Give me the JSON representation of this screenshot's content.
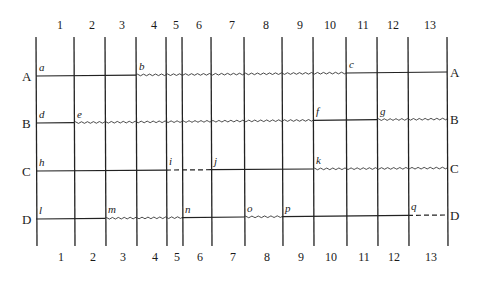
{
  "diagram": {
    "type": "precedence-grid",
    "columns": [
      "1",
      "2",
      "3",
      "4",
      "5",
      "6",
      "7",
      "8",
      "9",
      "10",
      "11",
      "12",
      "13"
    ],
    "column_lines_x": [
      36,
      74,
      105,
      136,
      166,
      182,
      211,
      244,
      282,
      313,
      346,
      377,
      408,
      447
    ],
    "column_label_x": [
      60,
      92,
      122,
      154,
      176,
      199,
      232,
      266,
      300,
      330,
      363,
      393,
      430
    ],
    "rows": [
      {
        "label": "A",
        "y_left": 76,
        "y_right": 72,
        "points": [
          {
            "name": "a",
            "line": 0
          },
          {
            "name": "b",
            "line": 3
          },
          {
            "name": "c",
            "line": 10
          }
        ],
        "segments": [
          {
            "from": 0,
            "to": 3,
            "style": "solid"
          },
          {
            "from": 3,
            "to": 10,
            "style": "wavy"
          },
          {
            "from": 10,
            "to": 13,
            "style": "solid"
          }
        ]
      },
      {
        "label": "B",
        "y_left": 123,
        "y_right": 119,
        "points": [
          {
            "name": "d",
            "line": 0
          },
          {
            "name": "e",
            "line": 1
          },
          {
            "name": "f",
            "line": 9
          },
          {
            "name": "g",
            "line": 11
          }
        ],
        "segments": [
          {
            "from": 0,
            "to": 1,
            "style": "solid"
          },
          {
            "from": 1,
            "to": 9,
            "style": "wavy"
          },
          {
            "from": 9,
            "to": 11,
            "style": "solid"
          },
          {
            "from": 11,
            "to": 13,
            "style": "wavy"
          }
        ]
      },
      {
        "label": "C",
        "y_left": 171,
        "y_right": 168,
        "points": [
          {
            "name": "h",
            "line": 0
          },
          {
            "name": "i",
            "line": 4
          },
          {
            "name": "j",
            "line": 6
          },
          {
            "name": "k",
            "line": 9
          }
        ],
        "segments": [
          {
            "from": 0,
            "to": 4,
            "style": "solid"
          },
          {
            "from": 4,
            "to": 6,
            "style": "dashed"
          },
          {
            "from": 6,
            "to": 9,
            "style": "solid"
          },
          {
            "from": 9,
            "to": 13,
            "style": "wavy"
          }
        ]
      },
      {
        "label": "D",
        "y_left": 219,
        "y_right": 215,
        "points": [
          {
            "name": "l",
            "line": 0
          },
          {
            "name": "m",
            "line": 2
          },
          {
            "name": "n",
            "line": 5
          },
          {
            "name": "o",
            "line": 7
          },
          {
            "name": "p",
            "line": 8
          },
          {
            "name": "q",
            "line": 12
          }
        ],
        "segments": [
          {
            "from": 0,
            "to": 2,
            "style": "solid"
          },
          {
            "from": 2,
            "to": 5,
            "style": "wavy"
          },
          {
            "from": 5,
            "to": 7,
            "style": "solid"
          },
          {
            "from": 7,
            "to": 8,
            "style": "wavy"
          },
          {
            "from": 8,
            "to": 12,
            "style": "solid"
          },
          {
            "from": 12,
            "to": 13,
            "style": "dashed"
          }
        ]
      }
    ],
    "line_top_y": 37,
    "line_bottom_y": 246,
    "top_labels_y": 29,
    "bottom_labels_y": 261,
    "legend": {
      "solid": "activity",
      "wavy": "float / slack",
      "dashed": "dummy / idle"
    }
  }
}
